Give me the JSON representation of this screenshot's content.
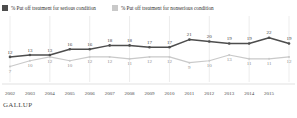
{
  "legend": {
    "items": [
      {
        "label": "% Put off treatment for serious condition",
        "color": "#4d4d4d",
        "icon": "square-swatch-icon"
      },
      {
        "label": "% Put off treatment for nonserious condition",
        "color": "#c9c9c9",
        "icon": "square-swatch-icon"
      }
    ]
  },
  "footer": {
    "brand": "GALLUP"
  },
  "chart_data": {
    "type": "line",
    "title": "",
    "subtitle": "",
    "xlabel": "",
    "ylabel": "",
    "ylim": [
      0,
      26
    ],
    "grid": true,
    "gridlines": "vertical",
    "legend_position": "top-left",
    "categories": [
      "2002",
      "2003",
      "2004",
      "2005",
      "2006",
      "2007",
      "2008",
      "2009",
      "2010",
      "2011",
      "2012",
      "2013",
      "2014",
      "2015",
      ""
    ],
    "x": [
      "2002",
      "2003",
      "2004",
      "2005",
      "2006",
      "2007",
      "2008",
      "2009",
      "2010",
      "2011",
      "2012",
      "2013",
      "2014",
      "2015",
      ""
    ],
    "series": [
      {
        "name": "% Put off treatment for serious condition",
        "color": "#4d4d4d",
        "values": [
          12,
          13,
          13,
          16,
          16,
          18,
          18,
          17,
          17,
          21,
          20,
          19,
          19,
          22,
          19
        ]
      },
      {
        "name": "% Put off treatment for nonserious condition",
        "color": "#c9c9c9",
        "values": [
          7,
          10,
          12,
          10,
          12,
          12,
          11,
          12,
          12,
          9,
          10,
          13,
          11,
          11,
          12
        ]
      }
    ]
  }
}
